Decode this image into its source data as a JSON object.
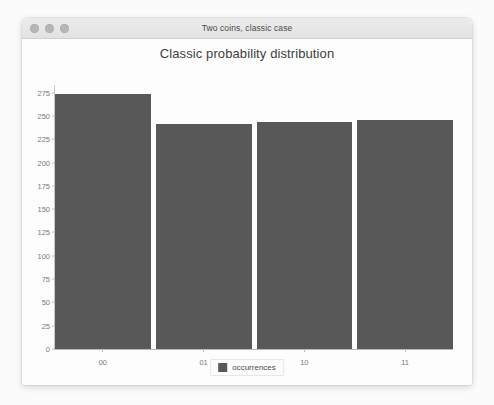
{
  "window": {
    "title": "Two coins, classic case",
    "traffic_lights": [
      {
        "name": "close",
        "color": "#b6b6b6"
      },
      {
        "name": "minimize",
        "color": "#b6b6b6"
      },
      {
        "name": "zoom",
        "color": "#b6b6b6"
      }
    ]
  },
  "chart_data": {
    "type": "bar",
    "title": "Classic probability distribution",
    "xlabel": "",
    "ylabel": "",
    "categories": [
      "00",
      "01",
      "10",
      "11"
    ],
    "values": [
      273,
      241,
      244,
      246
    ],
    "series": [
      {
        "name": "occurrences",
        "values": [
          273,
          241,
          244,
          246
        ],
        "color": "#585858"
      }
    ],
    "ylim": [
      0,
      281
    ],
    "yticks": [
      0,
      25,
      50,
      75,
      100,
      125,
      150,
      175,
      200,
      225,
      250,
      275
    ],
    "ytick_labels": [
      "0",
      "25",
      "50",
      "75",
      "100",
      "125",
      "150",
      "175",
      "200",
      "225",
      "250",
      "275"
    ],
    "grid": false,
    "legend": {
      "position": "bottom-center",
      "entries": [
        {
          "label": "occurrences",
          "color": "#585858"
        }
      ]
    }
  }
}
